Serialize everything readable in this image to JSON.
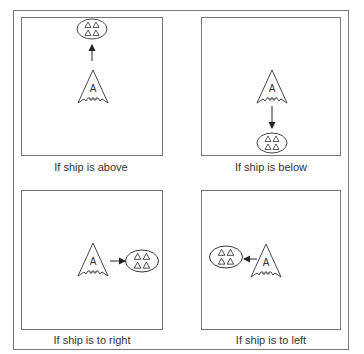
{
  "figure": {
    "stroke_color": "#6e6e6e",
    "ink_color": "#222222",
    "ship_label": "A",
    "panels": [
      {
        "id": "above",
        "caption": "If ship is above"
      },
      {
        "id": "below",
        "caption": "If ship is below"
      },
      {
        "id": "right",
        "caption": "If ship is to right"
      },
      {
        "id": "left",
        "caption": "If ship is to left"
      }
    ],
    "icons": {
      "ship": "arrowhead-ship-icon",
      "group": "oval-with-four-triangles-icon",
      "arrow": "direction-arrow-icon"
    }
  }
}
